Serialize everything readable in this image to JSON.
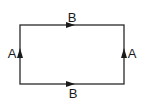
{
  "diagram": {
    "type": "rectangular loop with directed edges",
    "stroke_color": "#2a2a2a",
    "label_color": "#1a1a1a",
    "background": "#ffffff",
    "rect": {
      "left": 20,
      "top": 25,
      "right": 124,
      "bottom": 84
    },
    "edges": [
      {
        "id": "top",
        "label": "B",
        "direction": "right",
        "arrow_at": [
          72,
          25
        ],
        "label_pos": [
          72,
          17
        ]
      },
      {
        "id": "bottom",
        "label": "B",
        "direction": "right",
        "arrow_at": [
          72,
          84
        ],
        "label_pos": [
          73,
          93
        ]
      },
      {
        "id": "left",
        "label": "A",
        "direction": "up",
        "arrow_at": [
          20,
          53
        ],
        "label_pos": [
          12,
          53
        ]
      },
      {
        "id": "right",
        "label": "A",
        "direction": "up",
        "arrow_at": [
          124,
          53
        ],
        "label_pos": [
          132,
          53
        ]
      }
    ]
  }
}
